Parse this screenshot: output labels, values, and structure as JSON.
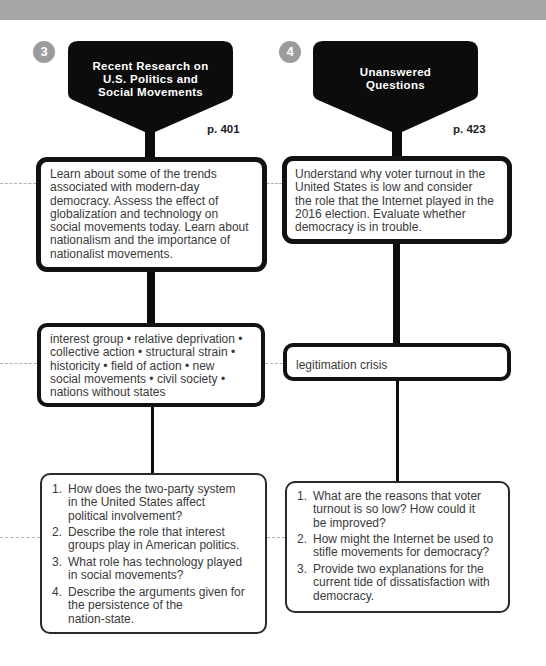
{
  "colors": {
    "header_band": "#a6a6a6",
    "step_circle": "#9c9c9c",
    "funnel": "#0c0c0c",
    "box_border": "#121212",
    "dashed_connector": "#b3b3b3",
    "text": "#3a3a3a"
  },
  "columns": [
    {
      "number": "3",
      "title_lines": [
        "Recent Research on",
        "U.S. Politics and",
        "Social Movements"
      ],
      "page_ref": "p. 401",
      "objectives": {
        "lines": [
          "Learn about some of the trends",
          "associated with modern-day",
          "democracy. Assess the effect of",
          "globalization and technology on",
          "social movements today. Learn about",
          "nationalism and the importance of",
          "nationalist movements."
        ]
      },
      "key_terms": {
        "lines": [
          "interest group • relative deprivation •",
          "collective action • structural strain •",
          "historicity • field of action • new",
          "social movements • civil society •",
          "nations without states"
        ]
      },
      "questions": [
        {
          "number": "1.",
          "lines": [
            "How does the two-party system",
            "in the United States affect",
            "political involvement?"
          ]
        },
        {
          "number": "2.",
          "lines": [
            "Describe the role that interest",
            "groups play in American politics."
          ]
        },
        {
          "number": "3.",
          "lines": [
            "What role has technology played",
            "in social movements?"
          ]
        },
        {
          "number": "4.",
          "lines": [
            "Describe the arguments given for",
            "the persistence of the",
            "nation-state."
          ]
        }
      ]
    },
    {
      "number": "4",
      "title_lines": [
        "Unanswered",
        "Questions"
      ],
      "page_ref": "p. 423",
      "objectives": {
        "lines": [
          "Understand why voter turnout in the",
          "United States is low and consider",
          "the role that the Internet played in the",
          "2016 election. Evaluate whether",
          "democracy is in trouble."
        ]
      },
      "key_terms": {
        "lines": [
          "legitimation crisis"
        ]
      },
      "questions": [
        {
          "number": "1.",
          "lines": [
            "What are the reasons that voter",
            "turnout is so low? How could it",
            "be improved?"
          ]
        },
        {
          "number": "2.",
          "lines": [
            "How might the Internet be used to",
            "stifle movements for democracy?"
          ]
        },
        {
          "number": "3.",
          "lines": [
            "Provide two explanations for the",
            "current tide of dissatisfaction with",
            "democracy."
          ]
        }
      ]
    }
  ]
}
